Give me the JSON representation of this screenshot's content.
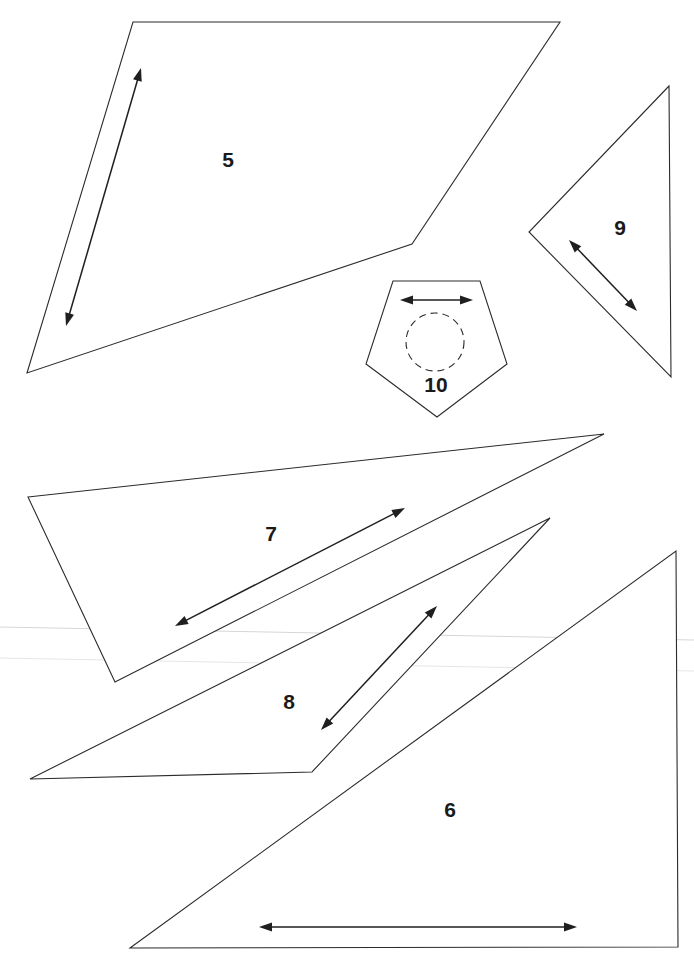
{
  "page": {
    "width": 694,
    "height": 965,
    "background": "#ffffff",
    "outline_color": "#2b2b2b",
    "arrow_color": "#1f1f1f",
    "label_color": "#1a1a1a"
  },
  "pieces": [
    {
      "id": "5",
      "label": "5",
      "shape": "quadrilateral",
      "points": [
        [
          133,
          22
        ],
        [
          560,
          22
        ],
        [
          412,
          244
        ],
        [
          27,
          373
        ]
      ],
      "label_pos": [
        228,
        161
      ],
      "grain_arrow": {
        "from": [
          141,
          68
        ],
        "to": [
          66,
          326
        ]
      }
    },
    {
      "id": "9",
      "label": "9",
      "shape": "triangle",
      "points": [
        [
          669,
          86
        ],
        [
          529,
          232
        ],
        [
          671,
          377
        ]
      ],
      "label_pos": [
        620,
        229
      ],
      "grain_arrow": {
        "from": [
          569,
          240
        ],
        "to": [
          637,
          311
        ]
      }
    },
    {
      "id": "10",
      "label": "10",
      "shape": "pentagon",
      "points": [
        [
          393,
          281
        ],
        [
          480,
          281
        ],
        [
          507,
          364
        ],
        [
          437,
          417
        ],
        [
          366,
          364
        ]
      ],
      "label_pos": [
        436,
        386
      ],
      "grain_arrow": {
        "from": [
          400,
          300
        ],
        "to": [
          473,
          300
        ]
      },
      "dashed_circle": {
        "cx": 435,
        "cy": 342,
        "r": 29
      }
    },
    {
      "id": "7",
      "label": "7",
      "shape": "triangle",
      "points": [
        [
          28,
          497
        ],
        [
          604,
          434
        ],
        [
          115,
          682
        ]
      ],
      "label_pos": [
        271,
        535
      ],
      "grain_arrow": {
        "from": [
          405,
          508
        ],
        "to": [
          175,
          626
        ]
      }
    },
    {
      "id": "8",
      "label": "8",
      "shape": "triangle",
      "points": [
        [
          30,
          779
        ],
        [
          550,
          518
        ],
        [
          312,
          772
        ]
      ],
      "label_pos": [
        289,
        703
      ],
      "grain_arrow": {
        "from": [
          437,
          606
        ],
        "to": [
          321,
          730
        ]
      }
    },
    {
      "id": "6",
      "label": "6",
      "shape": "triangle",
      "points": [
        [
          676,
          551
        ],
        [
          678,
          947
        ],
        [
          130,
          948
        ]
      ],
      "label_pos": [
        450,
        811
      ],
      "grain_arrow": {
        "from": [
          259,
          927
        ],
        "to": [
          577,
          927
        ]
      }
    }
  ],
  "scan_lines": [
    {
      "from": [
        0,
        627
      ],
      "to": [
        694,
        640
      ],
      "faint": false
    },
    {
      "from": [
        0,
        658
      ],
      "to": [
        694,
        671
      ],
      "faint": true
    }
  ]
}
